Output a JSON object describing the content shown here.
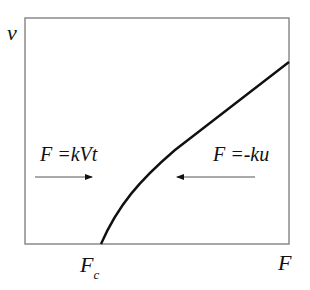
{
  "diagram": {
    "axes": {
      "y_label": "v",
      "x_label": "F",
      "x_marker": {
        "main": "F",
        "sub": "c"
      }
    },
    "annotations": {
      "left_equation": "F =kVt",
      "right_equation": "F =-ku",
      "left_arrow_direction": "right",
      "right_arrow_direction": "left"
    },
    "colors": {
      "frame": "#8a8a8a",
      "curve": "#111111",
      "arrow": "#555555"
    }
  }
}
